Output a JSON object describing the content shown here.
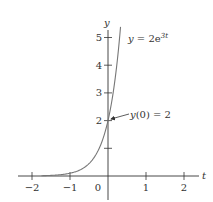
{
  "chart_data": {
    "type": "line",
    "title": "",
    "xlabel": "t",
    "ylabel": "y",
    "xlim": [
      -2.3,
      2.4
    ],
    "ylim": [
      -0.9,
      5.4
    ],
    "grid": false,
    "legend": null,
    "x_ticks": [
      -2,
      -1,
      0,
      1,
      2
    ],
    "x_tick_labels": [
      "−2",
      "−1",
      "0",
      "1",
      "2"
    ],
    "y_ticks": [
      1,
      2,
      3,
      4,
      5
    ],
    "y_tick_labels": [
      "",
      "2",
      "3",
      "4",
      "5"
    ],
    "series": [
      {
        "name": "y = 2e^{3t}",
        "function": "2*exp(3*t)",
        "t_range": [
          -1.75,
          0.33
        ],
        "x": [
          -1.75,
          -1.5,
          -1.25,
          -1.0,
          -0.75,
          -0.5,
          -0.25,
          0.0,
          0.1,
          0.2,
          0.3,
          0.33
        ],
        "values": [
          0.01,
          0.02,
          0.05,
          0.1,
          0.21,
          0.45,
          0.94,
          2.0,
          2.7,
          3.64,
          4.92,
          5.38
        ],
        "color": "#777777"
      }
    ],
    "annotations": [
      {
        "text_main": "y",
        "text_sup": "3t",
        "text_prefix": " = 2e",
        "position": [
          0.55,
          5.0
        ],
        "label": "y = 2e^{3t}"
      },
      {
        "label": "y(0) = 2",
        "text_i": "y",
        "text_rest": "(0) = 2",
        "position": [
          0.6,
          2.2
        ],
        "arrow_to": [
          0,
          2
        ]
      }
    ],
    "colors": {
      "axis": "#333333",
      "curve": "#777777",
      "text": "#333333"
    }
  }
}
